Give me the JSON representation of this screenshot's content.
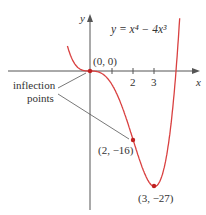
{
  "equation": "y = x⁴ − 4x³",
  "axes": {
    "x_label": "x",
    "y_label": "y",
    "x_ticks": [
      "2",
      "3"
    ]
  },
  "points": [
    {
      "label": "(0, 0)",
      "x": 0,
      "y": 0
    },
    {
      "label": "(2, −16)",
      "x": 2,
      "y": -16
    },
    {
      "label": "(3, −27)",
      "x": 3,
      "y": -27
    }
  ],
  "annotation": {
    "line1": "inflection",
    "line2": "points"
  },
  "colors": {
    "curve": "#d94040",
    "axis": "#555555"
  }
}
